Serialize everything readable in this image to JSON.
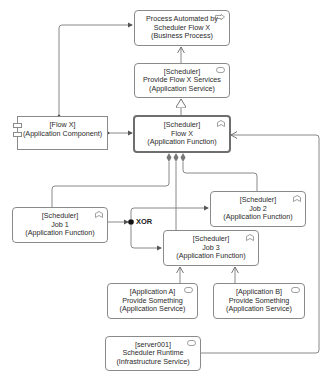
{
  "diagram": {
    "type": "ArchiMate view",
    "nodes": {
      "business_process": {
        "lines": [
          "Process Automated by",
          "Scheduler Flow X",
          "(Business Process)"
        ],
        "icon": "business-process-arrow-icon"
      },
      "flow_x_services": {
        "lines": [
          "[Scheduler]",
          "Provide Flow X Services",
          "(Application Service)"
        ],
        "icon": "service-pill-icon"
      },
      "flow_x_component": {
        "lines": [
          "[Flow X]",
          "(Application Component)"
        ],
        "icon": "component-icon"
      },
      "flow_x_function": {
        "lines": [
          "[Scheduler]",
          "Flow X",
          "(Application Function)"
        ],
        "icon": "function-chevron-icon"
      },
      "job1": {
        "lines": [
          "[Scheduler]",
          "Job 1",
          "(Application Function)"
        ],
        "icon": "function-chevron-icon"
      },
      "job2": {
        "lines": [
          "[Scheduler]",
          "Job 2",
          "(Application Function)"
        ],
        "icon": "function-chevron-icon"
      },
      "job3": {
        "lines": [
          "[Scheduler]",
          "Job 3",
          "(Application Function)"
        ],
        "icon": "function-chevron-icon"
      },
      "app_a": {
        "lines": [
          "[Application A]",
          "Provide Something",
          "(Application Service)"
        ],
        "icon": "service-pill-icon"
      },
      "app_b": {
        "lines": [
          "[Application B]",
          "Provide Something",
          "(Application Service)"
        ],
        "icon": "service-pill-icon"
      },
      "server001": {
        "lines": [
          "[server001]",
          "Scheduler Runtime",
          "(Infrastructure Service)"
        ],
        "icon": "service-pill-icon"
      }
    },
    "junction": {
      "label": "XOR"
    },
    "colors": {
      "border": "#8a8a8a",
      "bold_border": "#6e6e6e",
      "line": "#7a7a7a",
      "junction": "#111111",
      "text": "#2a2a2a",
      "background": "#ffffff"
    }
  }
}
